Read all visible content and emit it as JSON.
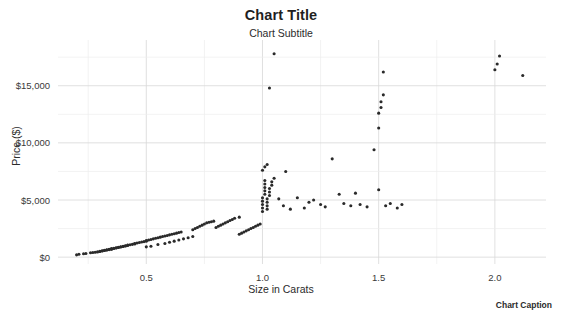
{
  "chart_data": {
    "type": "scatter",
    "title": "Chart Title",
    "subtitle": "Chart Subtitle",
    "caption": "Chart Caption",
    "xlabel": "Size in Carats",
    "ylabel": "Price ($)",
    "xlim": [
      0.12,
      2.22
    ],
    "ylim": [
      -600,
      19000
    ],
    "grid": true,
    "legend": false,
    "xticks": [
      0.5,
      1.0,
      1.5,
      2.0
    ],
    "xtick_labels": [
      "0.5",
      "1.0",
      "1.5",
      "2.0"
    ],
    "yticks": [
      0,
      5000,
      10000,
      15000
    ],
    "ytick_labels": [
      "$0",
      "$5,000",
      "$10,000",
      "$15,000"
    ],
    "x_minor_step": 0.25,
    "y_minor_step": 2500,
    "marker_color": "#2a2a2a",
    "marker_size": 3.1,
    "series": [
      {
        "name": "Diamonds",
        "x": [
          0.2,
          0.21,
          0.23,
          0.24,
          0.26,
          0.27,
          0.28,
          0.29,
          0.3,
          0.3,
          0.31,
          0.31,
          0.32,
          0.32,
          0.33,
          0.33,
          0.34,
          0.34,
          0.35,
          0.35,
          0.35,
          0.36,
          0.36,
          0.37,
          0.37,
          0.38,
          0.38,
          0.39,
          0.39,
          0.4,
          0.4,
          0.41,
          0.41,
          0.42,
          0.42,
          0.43,
          0.44,
          0.45,
          0.45,
          0.46,
          0.47,
          0.48,
          0.49,
          0.5,
          0.5,
          0.51,
          0.52,
          0.53,
          0.54,
          0.55,
          0.56,
          0.57,
          0.58,
          0.59,
          0.6,
          0.61,
          0.62,
          0.63,
          0.64,
          0.65,
          0.5,
          0.52,
          0.55,
          0.58,
          0.6,
          0.62,
          0.64,
          0.66,
          0.68,
          0.7,
          0.7,
          0.71,
          0.72,
          0.73,
          0.74,
          0.75,
          0.76,
          0.77,
          0.78,
          0.79,
          0.8,
          0.81,
          0.82,
          0.83,
          0.84,
          0.85,
          0.86,
          0.87,
          0.88,
          0.9,
          0.9,
          0.91,
          0.92,
          0.93,
          0.94,
          0.95,
          0.96,
          0.97,
          0.98,
          0.99,
          1.0,
          1.0,
          1.0,
          1.0,
          1.0,
          1.01,
          1.01,
          1.01,
          1.01,
          1.01,
          1.02,
          1.02,
          1.02,
          1.02,
          1.03,
          1.03,
          1.03,
          1.04,
          1.04,
          1.05,
          1.0,
          1.01,
          1.02,
          1.03,
          1.05,
          1.07,
          1.09,
          1.1,
          1.12,
          1.15,
          1.18,
          1.2,
          1.22,
          1.25,
          1.27,
          1.3,
          1.33,
          1.35,
          1.38,
          1.4,
          1.42,
          1.45,
          1.48,
          1.5,
          1.5,
          1.5,
          1.51,
          1.51,
          1.52,
          1.52,
          1.53,
          1.55,
          1.58,
          1.6,
          2.0,
          2.01,
          2.02,
          2.12
        ],
        "y": [
          200,
          250,
          300,
          320,
          380,
          400,
          430,
          460,
          500,
          520,
          540,
          560,
          580,
          600,
          620,
          640,
          660,
          680,
          700,
          720,
          740,
          760,
          780,
          800,
          820,
          850,
          870,
          890,
          910,
          930,
          950,
          980,
          1000,
          1030,
          1050,
          1080,
          1120,
          1160,
          1200,
          1240,
          1280,
          1320,
          1360,
          1400,
          1450,
          1500,
          1550,
          1600,
          1650,
          1700,
          1750,
          1800,
          1850,
          1900,
          1950,
          2000,
          2050,
          2100,
          2150,
          2200,
          900,
          950,
          1100,
          1200,
          1300,
          1400,
          1500,
          1600,
          1700,
          1800,
          2400,
          2500,
          2600,
          2700,
          2800,
          2900,
          3000,
          3050,
          3100,
          3150,
          2600,
          2700,
          2800,
          2900,
          3000,
          3100,
          3200,
          3300,
          3400,
          3500,
          2000,
          2100,
          2200,
          2300,
          2400,
          2500,
          2600,
          2700,
          2800,
          2900,
          4000,
          4300,
          4600,
          4900,
          5200,
          5500,
          5800,
          6100,
          6400,
          6700,
          4200,
          4500,
          4800,
          5100,
          5400,
          5700,
          6000,
          6300,
          6600,
          6900,
          7600,
          7900,
          8100,
          14800,
          17800,
          5100,
          4500,
          7500,
          4200,
          5200,
          4300,
          4800,
          5000,
          4600,
          4400,
          8600,
          5500,
          4700,
          4500,
          5600,
          4600,
          4400,
          9400,
          5900,
          11300,
          12600,
          13100,
          13600,
          14200,
          16200,
          4500,
          4700,
          4300,
          4600,
          16400,
          16900,
          17600,
          15900
        ]
      }
    ]
  }
}
